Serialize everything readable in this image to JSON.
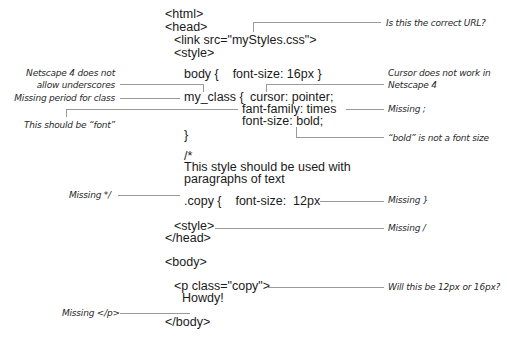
{
  "code_lines": {
    "html_open": "<html>",
    "head_open": "<head>",
    "link": "<link src=\"myStyles.css\">",
    "style_open": "<style>",
    "body_rule": "body {    font-size: 16px }",
    "myclass_sel": "my_class {",
    "cursor": "cursor: pointer;",
    "fant_family": "fant-family: times",
    "font_size_bold": "font-size: bold;",
    "close_brace": "}",
    "comment_open": "/*",
    "comment_1": "This style should be used with",
    "comment_2": "paragraphs of text",
    "copy_rule": ".copy {    font-size:  12px",
    "style_close_bad": "<style>",
    "head_close": "</head>",
    "body_open": "<body>",
    "p_open": "<p class=\"copy\">",
    "howdy": "Howdy!",
    "body_close": "</body>"
  },
  "annotations": {
    "url": "Is this the correct URL?",
    "underscores_1": "Netscape 4 does not",
    "underscores_2": "allow underscores",
    "period": "Missing period for class",
    "cursor_1": "Cursor does not work in",
    "cursor_2": "Netscape 4",
    "semicolon": "Missing ;",
    "font": "This should be “font”",
    "bold": "“bold” is not a font size",
    "comment_close": "Missing */",
    "brace": "Missing }",
    "slash": "Missing /",
    "size_question": "Will this be 12px or 16px?",
    "p_close": "Missing </p>"
  }
}
